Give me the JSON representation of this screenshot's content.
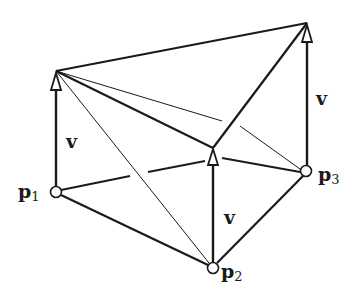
{
  "figure": {
    "line_color": "#1a1a1a",
    "background": "#ffffff"
  },
  "points": {
    "p1": {
      "label": "p",
      "sub": "1"
    },
    "p2": {
      "label": "p",
      "sub": "2"
    },
    "p3": {
      "label": "p",
      "sub": "3"
    }
  },
  "vectors": [
    {
      "id": "v1",
      "label": "v",
      "from": "p1"
    },
    {
      "id": "v2",
      "label": "v",
      "from": "p2"
    },
    {
      "id": "v3",
      "label": "v",
      "from": "p3"
    }
  ]
}
